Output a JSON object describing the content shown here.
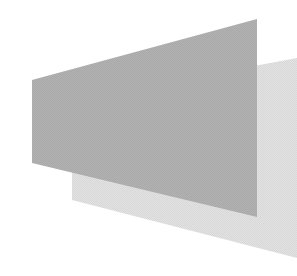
{
  "graphic": {
    "description": "Two overlapping gray perspective planes (trapezoids)",
    "background_color": "#ffffff",
    "shapes": [
      {
        "name": "back-plane",
        "fill": "#e3e3e3",
        "points": "72,100 297,58 297,258 72,200"
      },
      {
        "name": "front-plane",
        "fill": "#b2b2b2",
        "points": "32,80 257,19 257,217 32,163"
      }
    ]
  }
}
